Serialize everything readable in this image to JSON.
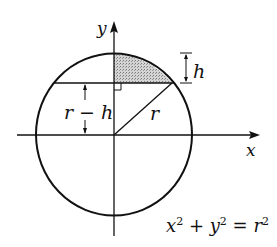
{
  "diagram": {
    "labels": {
      "y_axis": "y",
      "x_axis": "x",
      "height": "h",
      "distance": "r − h",
      "radius": "r",
      "equation": {
        "x": "x",
        "x_exp": "2",
        "plus": " + ",
        "y": "y",
        "y_exp": "2",
        "eq": " = ",
        "r": "r",
        "r_exp": "2"
      }
    },
    "colors": {
      "stroke": "#111111",
      "segment_fill": "#b8b8b8",
      "background": "#ffffff"
    },
    "geometry": {
      "center": [
        114,
        134
      ],
      "radius": 80,
      "chord_y": 83
    }
  }
}
